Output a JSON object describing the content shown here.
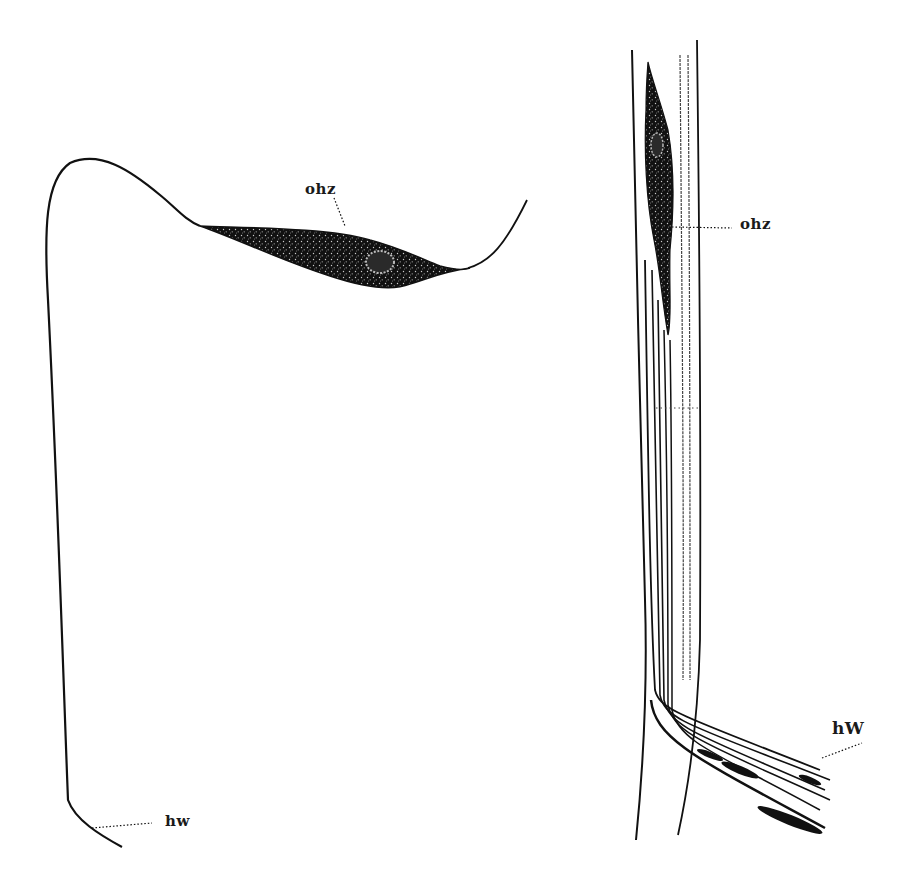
{
  "figure": {
    "background": "#ffffff",
    "ink_color": "#111111",
    "left_panel": {
      "cell_label": "ohz",
      "fiber_label": "hw"
    },
    "right_panel": {
      "cell_label": "ohz",
      "fiber_label": "hW"
    }
  }
}
